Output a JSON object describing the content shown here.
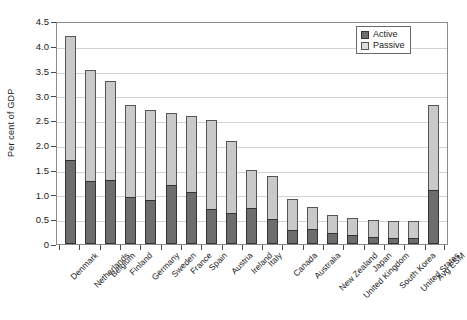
{
  "chart_data": {
    "type": "bar",
    "stacked": true,
    "title": "",
    "xlabel": "",
    "ylabel": "Per cent of GDP",
    "ylim": [
      0,
      4.5
    ],
    "ytick_step": 0.5,
    "yticks": [
      "4.5",
      "4.0",
      "3.5",
      "3.0",
      "2.5",
      "2.0",
      "1.5",
      "1.0",
      "0.5",
      "0"
    ],
    "grid": true,
    "legend_position": "top-right",
    "categories": [
      "Denmark",
      "Netherlands",
      "Belgium",
      "Finland",
      "Germany",
      "Sweden",
      "France",
      "Spain",
      "Austria",
      "Ireland",
      "Italy",
      "Canada",
      "Australia",
      "New Zealand",
      "United Kingdom",
      "Japan",
      "South Korea",
      "United States",
      "Avg ESM"
    ],
    "series": [
      {
        "name": "Active",
        "color": "#6d6d6d",
        "values": [
          1.7,
          1.28,
          1.3,
          0.95,
          0.88,
          1.2,
          1.05,
          0.7,
          0.63,
          0.72,
          0.5,
          0.28,
          0.3,
          0.22,
          0.18,
          0.15,
          0.12,
          0.13,
          1.1
        ]
      },
      {
        "name": "Passive",
        "color": "#c9c9c9",
        "values": [
          2.5,
          2.24,
          1.98,
          1.85,
          1.82,
          1.44,
          1.54,
          1.8,
          1.44,
          0.78,
          0.88,
          0.62,
          0.45,
          0.36,
          0.34,
          0.33,
          0.35,
          0.33,
          1.7
        ]
      }
    ],
    "totals": [
      4.2,
      3.52,
      3.28,
      2.8,
      2.7,
      2.64,
      2.59,
      2.5,
      2.07,
      1.5,
      1.38,
      0.9,
      0.75,
      0.58,
      0.52,
      0.48,
      0.47,
      0.46,
      2.8
    ]
  },
  "legend": {
    "items": [
      {
        "label": "Active"
      },
      {
        "label": "Passive"
      }
    ]
  }
}
